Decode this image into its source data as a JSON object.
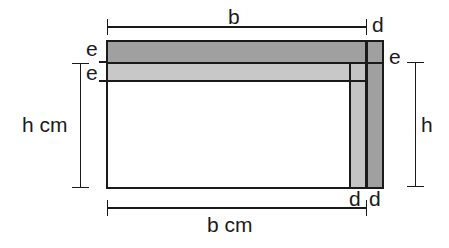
{
  "diagram": {
    "type": "engineering-dimension-diagram",
    "colors": {
      "stroke": "#1a1a1a",
      "band_dark": "#a0a0a0",
      "band_light": "#c8c8c8",
      "strip_light": "#c4c4c4",
      "strip_dark": "#a0a0a0",
      "interior": "#ffffff",
      "background": "#ffffff"
    },
    "labels": {
      "b_top": "b",
      "d_top": "d",
      "e_left_upper": "e",
      "e_left_lower": "e",
      "e_right": "e",
      "h_cm_left": "h cm",
      "h_right": "h",
      "d_bottom_left": "d",
      "d_bottom_right": "d",
      "b_cm_bottom": "b cm"
    },
    "geometry": {
      "outer_rect": {
        "x": 107,
        "y": 41,
        "width": 276,
        "height": 147
      },
      "band_top_dark": {
        "x": 107,
        "y": 41,
        "width": 276,
        "height": 21
      },
      "band_second_light": {
        "x": 107,
        "y": 64,
        "width": 243,
        "height": 17
      },
      "strip_vertical_light": {
        "x": 350,
        "y": 64,
        "width": 16,
        "height": 124
      },
      "strip_vertical_dark": {
        "x": 367,
        "y": 41,
        "width": 16,
        "height": 147
      },
      "interior_white": {
        "x": 107,
        "y": 82,
        "width": 243,
        "height": 106
      }
    },
    "dimension_lines": {
      "b_top": {
        "x1": 107,
        "x2": 367,
        "y": 27
      },
      "b_cm_bottom": {
        "x1": 107,
        "x2": 367,
        "y": 208
      },
      "h_cm_left": {
        "x": 80,
        "y1": 63,
        "y2": 188
      },
      "h_right": {
        "x": 415,
        "y1": 62,
        "y2": 187
      }
    }
  }
}
